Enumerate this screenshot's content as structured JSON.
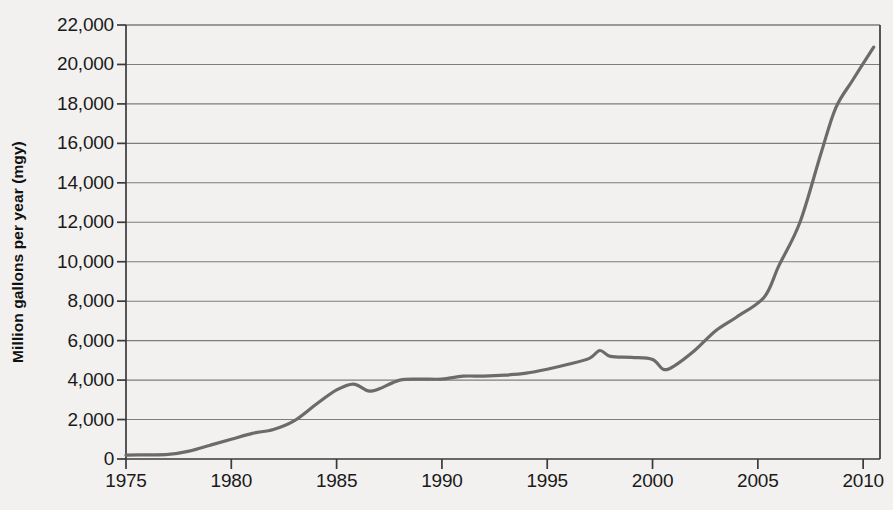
{
  "chart_data": {
    "type": "line",
    "title": "",
    "subtitle": "",
    "xlabel": "",
    "ylabel": "Million gallons per year (mgy)",
    "xlim": [
      1975,
      2010.8
    ],
    "ylim": [
      0,
      22000
    ],
    "grid": true,
    "grid_axis": "y",
    "legend": false,
    "legend_position": "none",
    "line_color": "#6b6b6b",
    "background_color": "#f2f1ef",
    "axis_color": "#3a3a3a",
    "gridline_color": "#7d7d7d",
    "x_ticks": [
      1975,
      1980,
      1985,
      1990,
      1995,
      2000,
      2005,
      2010
    ],
    "x_tick_labels": [
      "1975",
      "1980",
      "1985",
      "1990",
      "1995",
      "2000",
      "2005",
      "2010"
    ],
    "y_ticks": [
      0,
      2000,
      4000,
      6000,
      8000,
      10000,
      12000,
      14000,
      16000,
      18000,
      20000,
      22000
    ],
    "y_tick_labels": [
      "0",
      "2,000",
      "4,000",
      "6,000",
      "8,000",
      "10,000",
      "12,000",
      "14,000",
      "16,000",
      "18,000",
      "20,000",
      "22,000"
    ],
    "series": [
      {
        "name": "Fuel ethanol production",
        "x": [
          1975,
          1976,
          1977,
          1978,
          1979,
          1980,
          1981,
          1982,
          1983,
          1984,
          1985,
          1985.8,
          1986.5,
          1987,
          1988,
          1989,
          1990,
          1991,
          1992,
          1993,
          1994,
          1995,
          1996,
          1997,
          1997.5,
          1998,
          1999,
          2000,
          2000.5,
          2001,
          2002,
          2003,
          2004,
          2005.3,
          2006,
          2007,
          2008,
          2008.7,
          2009.5,
          2010.5
        ],
        "y": [
          200,
          210,
          230,
          400,
          700,
          1000,
          1300,
          1500,
          1950,
          2750,
          3500,
          3800,
          3450,
          3550,
          4000,
          4050,
          4050,
          4200,
          4200,
          4250,
          4350,
          4550,
          4800,
          5100,
          5500,
          5200,
          5150,
          5050,
          4550,
          4700,
          5500,
          6500,
          7200,
          8200,
          9800,
          12000,
          15500,
          17800,
          19200,
          20880
        ]
      }
    ],
    "annotations": []
  }
}
